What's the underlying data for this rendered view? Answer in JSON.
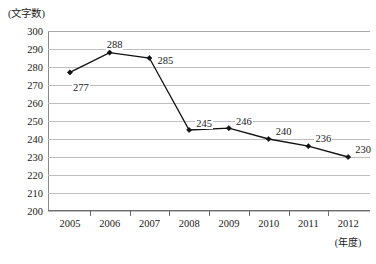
{
  "chart_data": {
    "type": "line",
    "title": "",
    "subtitle": "",
    "xlabel": "(年度)",
    "ylabel": "(文字数)",
    "categories": [
      "2005",
      "2006",
      "2007",
      "2008",
      "2009",
      "2010",
      "2011",
      "2012"
    ],
    "values": [
      277,
      288,
      285,
      245,
      246,
      240,
      236,
      230
    ],
    "series": [
      {
        "name": "文字数",
        "values": [
          277,
          288,
          285,
          245,
          246,
          240,
          236,
          230
        ]
      }
    ],
    "ylim": [
      200,
      300
    ],
    "ytick_step": 10,
    "yticks": [
      "300",
      "290",
      "280",
      "270",
      "260",
      "250",
      "240",
      "230",
      "220",
      "210",
      "200"
    ],
    "grid": "horizontal",
    "legend": "none",
    "data_labels": [
      "277",
      "288",
      "285",
      "245",
      "246",
      "240",
      "236",
      "230"
    ],
    "marker": "diamond",
    "line_color": "#111111",
    "grid_color": "#bdbdbd",
    "axis_color": "#6e6e6e"
  },
  "axes": {
    "y_unit_caption": "(文字数)",
    "x_unit_caption": "(年度)"
  },
  "footer": {
    "clipped_text": ""
  }
}
